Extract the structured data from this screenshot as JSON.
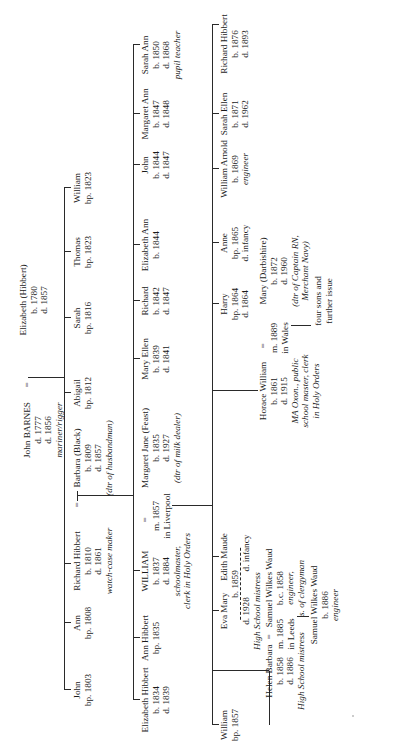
{
  "gen1": {
    "husband": {
      "name": "John BARNES",
      "lines": [
        "d. 1777",
        "d. 1856"
      ],
      "note": "mariner/rigger"
    },
    "marriage_symbol": "=",
    "wife": {
      "name": "Elizabeth (Hibbert)",
      "lines": [
        "b. 1780",
        "d. 1857"
      ]
    }
  },
  "gen2": [
    {
      "name": "John",
      "lines": [
        "bp. 1803"
      ]
    },
    {
      "name": "Ann",
      "lines": [
        "bp. 1808"
      ]
    },
    {
      "name": "Richard Hibbert",
      "lines": [
        "b. 1810",
        "d. 1861"
      ],
      "note": "watch-case maker"
    },
    {
      "name": "Barbara (Black)",
      "lines": [
        "b. 1809",
        "d. 1857"
      ],
      "note": "(dtr of husbandman)"
    },
    {
      "name": "Abigail",
      "lines": [
        "bp. 1812"
      ]
    },
    {
      "name": "Sarah",
      "lines": [
        "bp. 1816"
      ]
    },
    {
      "name": "Thomas",
      "lines": [
        "bp. 1823"
      ]
    },
    {
      "name": "William",
      "lines": [
        "bp. 1823"
      ]
    }
  ],
  "gen3": [
    {
      "name": "Elizabeth Hibbert",
      "lines": [
        "b. 1834",
        "d. 1839"
      ]
    },
    {
      "name": "Ann Hibbert",
      "lines": [
        "bp. 1835"
      ]
    },
    {
      "name": "WILLIAM",
      "lines": [
        "b. 1837",
        "d. 1884"
      ],
      "note": [
        "schoolmaster,",
        "clerk in Holy Orders"
      ]
    },
    {
      "marriage": [
        "m. 1857",
        "in Liverpool"
      ]
    },
    {
      "name": "Margaret Jane (Feast)",
      "lines": [
        "b. 1835",
        "d. 1927"
      ],
      "note": "(dtr of milk dealer)"
    },
    {
      "name": "Mary Ellen",
      "lines": [
        "b. 1839",
        "d. 1841"
      ]
    },
    {
      "name": "Richard",
      "lines": [
        "b. 1842",
        "d. 1847"
      ]
    },
    {
      "name": "Elizabeth Ann",
      "lines": [
        "b. 1844"
      ]
    },
    {
      "name": "John",
      "lines": [
        "b. 1844",
        "d. 1847"
      ]
    },
    {
      "name": "Margaret Ann",
      "lines": [
        "b. 1847",
        "d. 1848"
      ]
    },
    {
      "name": "Sarah Ann",
      "lines": [
        "b. 1850",
        "d. 1868"
      ],
      "note": "pupil teacher"
    }
  ],
  "gen4": [
    {
      "name": "William",
      "lines": [
        "bp. 1857"
      ]
    },
    {
      "name": "Eva Mary",
      "lines": [
        "d. 1928"
      ],
      "note": "High School  mistress"
    },
    {
      "twins_birth": "b. 1859"
    },
    {
      "name": "Edith Maude",
      "lines": [
        "d. infancy"
      ]
    },
    {
      "name": "Horace William",
      "lines": [
        "b. 1861",
        "d. 1915"
      ],
      "note": [
        "MA Oxon., public",
        "school master, clerk",
        "in Holy Orders"
      ]
    },
    {
      "marriage": [
        "m. 1889",
        "in Wales"
      ]
    },
    {
      "name": "Mary (Darbishire)",
      "lines": [
        "b. 1872",
        "d. 1960"
      ],
      "note": [
        "(dtr of Captain RN,",
        "Merchant Navy)"
      ]
    },
    {
      "issue": [
        "four sons and",
        "further issue"
      ]
    },
    {
      "name": "Harry",
      "lines": [
        "bp. 1864",
        "d. 1864"
      ]
    },
    {
      "name": "Anne",
      "lines": [
        "bp. 1865",
        "d. infancy"
      ]
    },
    {
      "name": "William Arnold",
      "lines": [
        "b. 1869"
      ],
      "note": "engineer"
    },
    {
      "name": "Sarah Ellen",
      "lines": [
        "b. 1871",
        "d. 1962"
      ]
    },
    {
      "name": "Richard Hibbert",
      "lines": [
        "b. 1876",
        "d. 1893"
      ]
    }
  ],
  "gen5": {
    "helen": {
      "name": "Helen Barbara",
      "lines": [
        "b. 1858",
        "d. 1886"
      ],
      "note": "High School mistress"
    },
    "marriage": [
      "m. 1885",
      "in Leeds"
    ],
    "spouse": {
      "name": "Samuel Wilkes Waud",
      "lines": [
        "b.c. 1858"
      ],
      "note": [
        "engineer,",
        "s. of clergyman"
      ]
    },
    "child": {
      "name": "Samuel Wilkes Waud",
      "lines": [
        "b. 1886"
      ],
      "note": "engineer"
    }
  }
}
